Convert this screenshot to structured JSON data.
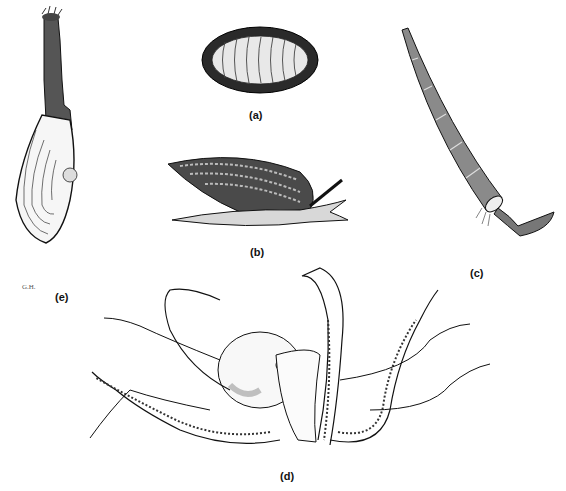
{
  "figure": {
    "panels": [
      {
        "id": "a",
        "label": "(a)",
        "subject": "chiton"
      },
      {
        "id": "b",
        "label": "(b)",
        "subject": "snail"
      },
      {
        "id": "c",
        "label": "(c)",
        "subject": "tusk-shell"
      },
      {
        "id": "d",
        "label": "(d)",
        "subject": "octopus"
      },
      {
        "id": "e",
        "label": "(e)",
        "subject": "clam"
      }
    ],
    "signature": "G.H.",
    "colors": {
      "ink": "#1a1a1a",
      "paper": "#ffffff",
      "stipple": "#666666"
    }
  }
}
